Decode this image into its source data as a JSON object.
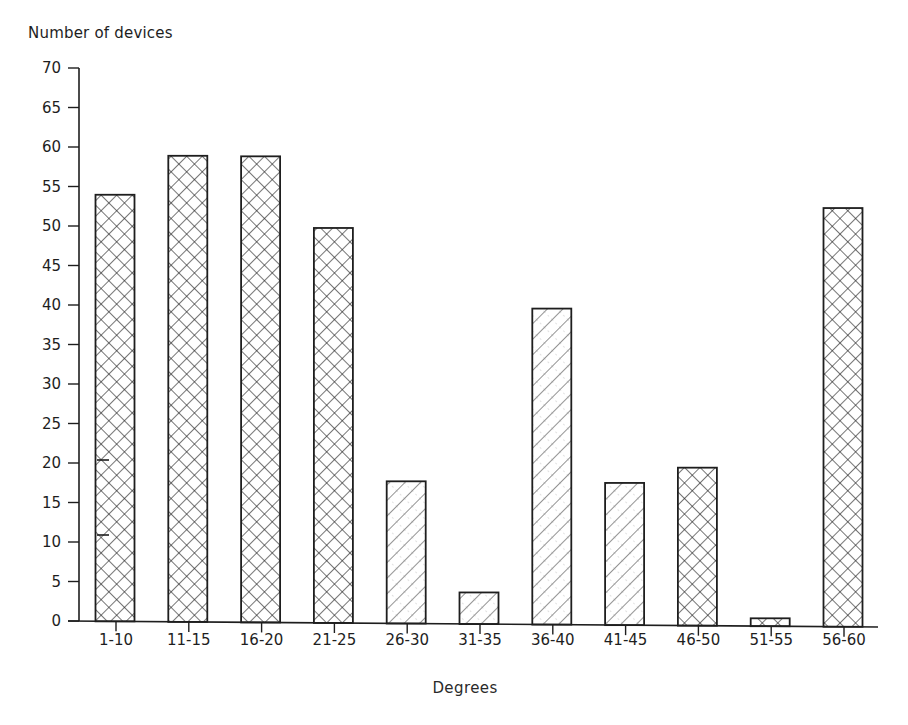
{
  "chart_data": {
    "type": "bar",
    "title": "",
    "ylabel": "Number of devices",
    "xlabel": "Degrees",
    "categories": [
      "1-10",
      "11-15",
      "16-20",
      "21-25",
      "26-30",
      "31-35",
      "36-40",
      "41-45",
      "46-50",
      "51-55",
      "56-60"
    ],
    "values": [
      54,
      59,
      59,
      50,
      18,
      4,
      40,
      18,
      20,
      1,
      53
    ],
    "patterns": [
      "crosshatch",
      "crosshatch",
      "crosshatch",
      "crosshatch",
      "diagonal",
      "diagonal",
      "diagonal",
      "diagonal",
      "crosshatch",
      "crosshatch",
      "crosshatch"
    ],
    "ylim": [
      0,
      70
    ],
    "yticks": [
      0,
      5,
      10,
      15,
      20,
      25,
      30,
      35,
      40,
      45,
      50,
      55,
      60,
      65,
      70
    ],
    "grid": false,
    "legend": null
  },
  "colors": {
    "ink": "#1e1e1e",
    "background": "#ffffff"
  }
}
